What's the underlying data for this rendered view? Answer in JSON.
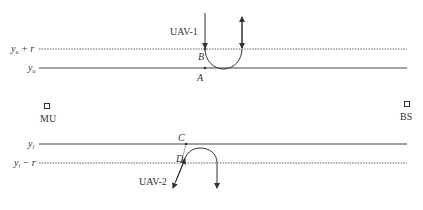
{
  "diagram": {
    "type": "uav-trajectory",
    "lines": {
      "upper_dotted": {
        "label": "y",
        "sub": "u",
        "suffix": " + r"
      },
      "upper_solid": {
        "label": "y",
        "sub": "u",
        "suffix": ""
      },
      "lower_solid": {
        "label": "y",
        "sub": "l",
        "suffix": ""
      },
      "lower_dotted": {
        "label": "y",
        "sub": "l",
        "suffix": " − r"
      }
    },
    "uavs": [
      {
        "name": "UAV-1"
      },
      {
        "name": "UAV-2"
      }
    ],
    "points": {
      "A": "A",
      "B": "B",
      "C": "C",
      "D": "D"
    },
    "nodes": {
      "mu": "MU",
      "bs": "BS"
    },
    "colors": {
      "line": "#444444",
      "text": "#333333",
      "background": "#ffffff"
    }
  }
}
